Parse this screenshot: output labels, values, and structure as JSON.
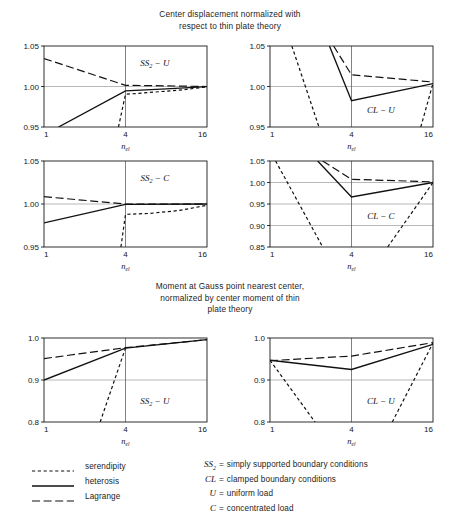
{
  "titles": {
    "displacement": [
      "Center displacement normalized with",
      "respect to thin plate theory"
    ],
    "moment": [
      "Moment at Gauss point nearest center,",
      "normalized by center moment of thin",
      "plate theory"
    ]
  },
  "legend": {
    "items": [
      {
        "label": "serendipity",
        "style": "shortdash"
      },
      {
        "label": "heterosis",
        "style": "solid"
      },
      {
        "label": "Lagrange",
        "style": "longdash"
      }
    ]
  },
  "definitions": [
    {
      "symbol": "SS",
      "subscript": "2",
      "equals": "=",
      "text": "simply supported boundary conditions"
    },
    {
      "symbol": "CL",
      "subscript": "",
      "equals": "=",
      "text": "clamped boundary conditions"
    },
    {
      "symbol": "U",
      "subscript": "",
      "equals": "=",
      "text": "uniform load"
    },
    {
      "symbol": "C",
      "subscript": "",
      "equals": "=",
      "text": "concentrated load"
    }
  ],
  "chart_data": [
    {
      "id": "ss2-u-displacement",
      "type": "line",
      "panel_label": "SS₂ − U",
      "title": "Center displacement normalized with respect to thin plate theory",
      "xlabel": "n_el",
      "ylabel": "",
      "x_ticks": [
        1,
        4,
        16
      ],
      "x_tick_labels": [
        "1",
        "4",
        "16"
      ],
      "x_scale": "log",
      "ylim": [
        0.95,
        1.05
      ],
      "y_ticks": [
        0.95,
        1.0,
        1.05
      ],
      "y_tick_labels": [
        "0.95",
        "1.00",
        "1.05"
      ],
      "grid": true,
      "series": [
        {
          "name": "serendipity",
          "style": "shortdash",
          "x": [
            3.55,
            4,
            5,
            7,
            10,
            16
          ],
          "values": [
            0.95,
            0.9905,
            0.9915,
            0.9935,
            0.9955,
            0.9995
          ]
        },
        {
          "name": "heterosis",
          "style": "solid",
          "x": [
            1.28,
            4,
            8,
            16
          ],
          "values": [
            0.95,
            0.9945,
            0.997,
            0.9998
          ]
        },
        {
          "name": "Lagrange",
          "style": "longdash",
          "x": [
            1,
            4,
            8,
            16
          ],
          "values": [
            1.0345,
            1.0015,
            1.0008,
            1.0
          ]
        }
      ]
    },
    {
      "id": "cl-u-displacement",
      "type": "line",
      "panel_label": "CL − U",
      "xlabel": "n_el",
      "x_ticks": [
        1,
        4,
        16
      ],
      "x_tick_labels": [
        "1",
        "4",
        "16"
      ],
      "x_scale": "log",
      "ylim": [
        0.95,
        1.05
      ],
      "y_ticks": [
        0.95,
        1.0,
        1.05
      ],
      "y_tick_labels": [
        "0.95",
        "1.00",
        "1.05"
      ],
      "grid": true,
      "series": [
        {
          "name": "serendipity-left",
          "style": "shortdash",
          "x": [
            1.45,
            2.3
          ],
          "values": [
            1.05,
            0.95
          ]
        },
        {
          "name": "serendipity-right",
          "style": "shortdash",
          "x": [
            13.0,
            16
          ],
          "values": [
            0.95,
            1.004
          ]
        },
        {
          "name": "heterosis",
          "style": "solid",
          "x": [
            2.75,
            4,
            16
          ],
          "values": [
            1.05,
            0.9825,
            1.0035
          ]
        },
        {
          "name": "Lagrange",
          "style": "longdash",
          "x": [
            2.95,
            4,
            16
          ],
          "values": [
            1.05,
            1.0145,
            1.0055
          ]
        }
      ]
    },
    {
      "id": "ss2-c-displacement",
      "type": "line",
      "panel_label": "SS₂ − C",
      "xlabel": "n_el",
      "x_ticks": [
        1,
        4,
        16
      ],
      "x_tick_labels": [
        "1",
        "4",
        "16"
      ],
      "x_scale": "log",
      "ylim": [
        0.95,
        1.05
      ],
      "y_ticks": [
        0.95,
        1.0,
        1.05
      ],
      "y_tick_labels": [
        "0.95",
        "1.00",
        "1.05"
      ],
      "grid": true,
      "series": [
        {
          "name": "serendipity",
          "style": "shortdash",
          "x": [
            3.7,
            4,
            6,
            10,
            16
          ],
          "values": [
            0.95,
            0.988,
            0.989,
            0.9925,
            0.9985
          ]
        },
        {
          "name": "heterosis",
          "style": "solid",
          "x": [
            1,
            4,
            16
          ],
          "values": [
            0.978,
            0.9995,
            1.0
          ]
        },
        {
          "name": "Lagrange",
          "style": "longdash",
          "x": [
            1,
            4,
            16
          ],
          "values": [
            1.0085,
            1.0,
            0.9998
          ]
        }
      ]
    },
    {
      "id": "cl-c-displacement",
      "type": "line",
      "panel_label": "CL − C",
      "xlabel": "n_el",
      "x_ticks": [
        1,
        4,
        16
      ],
      "x_tick_labels": [
        "1",
        "4",
        "16"
      ],
      "x_scale": "log",
      "ylim": [
        0.85,
        1.05
      ],
      "y_ticks": [
        0.85,
        0.9,
        0.95,
        1.0,
        1.05
      ],
      "y_tick_labels": [
        "0.85",
        "0.90",
        "0.95",
        "1.00",
        "1.05"
      ],
      "grid": true,
      "series": [
        {
          "name": "serendipity-left",
          "style": "shortdash",
          "x": [
            1.1,
            2.45
          ],
          "values": [
            1.05,
            0.85
          ]
        },
        {
          "name": "serendipity-right",
          "style": "shortdash",
          "x": [
            7.4,
            16
          ],
          "values": [
            0.85,
            1.0
          ]
        },
        {
          "name": "heterosis",
          "style": "solid",
          "x": [
            2.25,
            4,
            16
          ],
          "values": [
            1.05,
            0.9665,
            1.0
          ]
        },
        {
          "name": "Lagrange",
          "style": "longdash",
          "x": [
            2.45,
            4,
            16
          ],
          "values": [
            1.05,
            1.0075,
            1.0015
          ]
        }
      ]
    },
    {
      "id": "ss2-u-moment",
      "type": "line",
      "panel_label": "SS₂ − U",
      "title": "Moment at Gauss point nearest center, normalized by center moment of thin plate theory",
      "xlabel": "n_el",
      "x_ticks": [
        1,
        4,
        16
      ],
      "x_tick_labels": [
        "1",
        "4",
        "16"
      ],
      "x_scale": "log",
      "ylim": [
        0.8,
        1.0
      ],
      "y_ticks": [
        0.8,
        0.9,
        1.0
      ],
      "y_tick_labels": [
        "0.8",
        "0.9",
        "1.0"
      ],
      "grid": true,
      "series": [
        {
          "name": "serendipity",
          "style": "shortdash",
          "x": [
            2.6,
            4
          ],
          "values": [
            0.8,
            0.976
          ]
        },
        {
          "name": "heterosis",
          "style": "solid",
          "x": [
            1,
            4,
            16
          ],
          "values": [
            0.9,
            0.976,
            0.996
          ]
        },
        {
          "name": "Lagrange",
          "style": "longdash",
          "x": [
            1,
            4,
            16
          ],
          "values": [
            0.951,
            0.977,
            0.996
          ]
        }
      ]
    },
    {
      "id": "cl-u-moment",
      "type": "line",
      "panel_label": "CL − U",
      "xlabel": "n_el",
      "x_ticks": [
        1,
        4,
        16
      ],
      "x_tick_labels": [
        "1",
        "4",
        "16"
      ],
      "x_scale": "log",
      "ylim": [
        0.8,
        1.0
      ],
      "y_ticks": [
        0.8,
        0.9,
        1.0
      ],
      "y_tick_labels": [
        "0.8",
        "0.9",
        "1.0"
      ],
      "grid": true,
      "series": [
        {
          "name": "serendipity-left",
          "style": "shortdash",
          "x": [
            1,
            2.15
          ],
          "values": [
            0.947,
            0.8
          ]
        },
        {
          "name": "serendipity-right",
          "style": "shortdash",
          "x": [
            8.0,
            16
          ],
          "values": [
            0.8,
            0.988
          ]
        },
        {
          "name": "heterosis",
          "style": "solid",
          "x": [
            1,
            4,
            16
          ],
          "values": [
            0.947,
            0.925,
            0.985
          ]
        },
        {
          "name": "Lagrange",
          "style": "longdash",
          "x": [
            1,
            4,
            16
          ],
          "values": [
            0.946,
            0.957,
            0.989
          ]
        }
      ]
    }
  ],
  "chart_positions": [
    {
      "id": "ss2-u-displacement",
      "left": 14,
      "top": 38,
      "width": 205,
      "height": 115
    },
    {
      "id": "cl-u-displacement",
      "left": 240,
      "top": 38,
      "width": 205,
      "height": 115
    },
    {
      "id": "ss2-c-displacement",
      "left": 14,
      "top": 153,
      "width": 205,
      "height": 120
    },
    {
      "id": "cl-c-displacement",
      "left": 240,
      "top": 153,
      "width": 205,
      "height": 120
    },
    {
      "id": "ss2-u-moment",
      "left": 14,
      "top": 330,
      "width": 205,
      "height": 118
    },
    {
      "id": "cl-u-moment",
      "left": 240,
      "top": 330,
      "width": 205,
      "height": 118
    }
  ]
}
